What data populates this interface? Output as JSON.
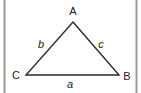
{
  "diagram": {
    "type": "triangle",
    "vertices": [
      {
        "label": "A",
        "x": 73,
        "y": 22
      },
      {
        "label": "B",
        "x": 119,
        "y": 75
      },
      {
        "label": "C",
        "x": 26,
        "y": 75
      }
    ],
    "sides": [
      {
        "label": "a",
        "between": "B-C",
        "opposite": "A"
      },
      {
        "label": "b",
        "between": "A-C",
        "opposite": "B"
      },
      {
        "label": "c",
        "between": "A-B",
        "opposite": "C"
      }
    ],
    "colors": {
      "line": "#2a2a2a",
      "frame": "#9a9a9a",
      "text": "#222222",
      "background": "#ffffff"
    }
  },
  "labels": {
    "A": "A",
    "B": "B",
    "C": "C",
    "a": "a",
    "b": "b",
    "c": "c"
  }
}
